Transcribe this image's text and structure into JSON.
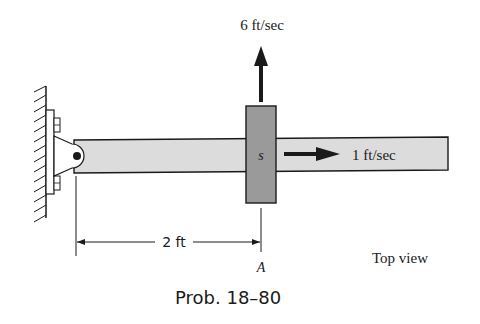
{
  "figure": {
    "caption": "Prob. 18–80",
    "view_label": "Top view",
    "collar_label": "s",
    "point_label": "A",
    "dimension": {
      "label": "2 ft",
      "value": 2,
      "unit": "ft"
    },
    "velocities": [
      {
        "label": "6 ft/sec",
        "value": 6,
        "unit": "ft/sec",
        "direction": "up"
      },
      {
        "label": "1 ft/sec",
        "value": 1,
        "unit": "ft/sec",
        "direction": "right"
      }
    ],
    "colors": {
      "bar_fill": "#dcdcdc",
      "collar_fill": "#9a9a9a",
      "ink": "#1a1a1a",
      "bracket_fill": "#ffffff"
    }
  }
}
